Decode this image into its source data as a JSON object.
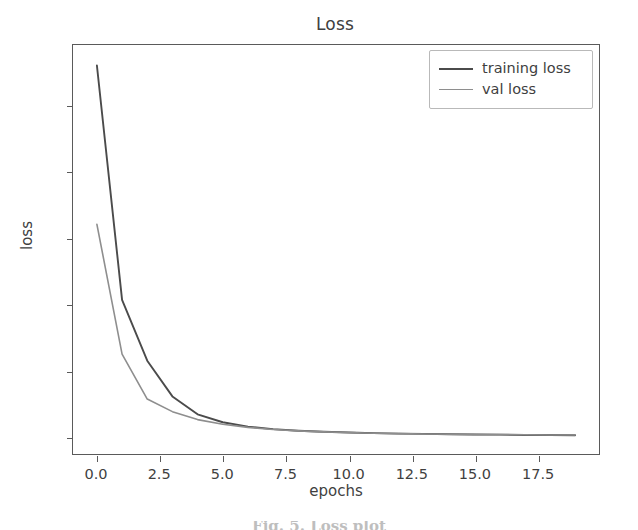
{
  "chart_data": {
    "type": "line",
    "title": "Loss",
    "xlabel": "epochs",
    "ylabel": "loss",
    "grid": false,
    "legend_position": "upper right",
    "xlim": [
      -0.95,
      19.95
    ],
    "ylim": [
      -0.135,
      2.955
    ],
    "xticks": [
      0.0,
      2.5,
      5.0,
      7.5,
      10.0,
      12.5,
      15.0,
      17.5
    ],
    "xticklabels": [
      "0.0",
      "2.5",
      "5.0",
      "7.5",
      "10.0",
      "12.5",
      "15.0",
      "17.5"
    ],
    "yticks": [
      0.0,
      0.5,
      1.0,
      1.5,
      2.0,
      2.5
    ],
    "yticklabels": [
      "0.0",
      "0.5",
      "1.0",
      "1.5",
      "2.0",
      "2.5"
    ],
    "x": [
      0,
      1,
      2,
      3,
      4,
      5,
      6,
      7,
      8,
      9,
      10,
      11,
      12,
      13,
      14,
      15,
      16,
      17,
      18,
      19
    ],
    "series": [
      {
        "name": "training loss",
        "color": "#4b4b4b",
        "linewidth": 1.9,
        "values": [
          2.8,
          1.03,
          0.57,
          0.3,
          0.165,
          0.105,
          0.072,
          0.053,
          0.041,
          0.033,
          0.027,
          0.023,
          0.019,
          0.017,
          0.014,
          0.012,
          0.011,
          0.009,
          0.008,
          0.007
        ]
      },
      {
        "name": "val loss",
        "color": "#8e8e8e",
        "linewidth": 1.6,
        "values": [
          1.6,
          0.62,
          0.28,
          0.185,
          0.125,
          0.09,
          0.066,
          0.05,
          0.04,
          0.032,
          0.027,
          0.022,
          0.019,
          0.016,
          0.014,
          0.012,
          0.011,
          0.01,
          0.009,
          0.008
        ]
      }
    ]
  },
  "legend": {
    "entries": [
      {
        "label": "training loss",
        "style": "train"
      },
      {
        "label": "val loss",
        "style": "val"
      }
    ]
  },
  "caption": {
    "text": "Fig. 5. Loss plot"
  }
}
